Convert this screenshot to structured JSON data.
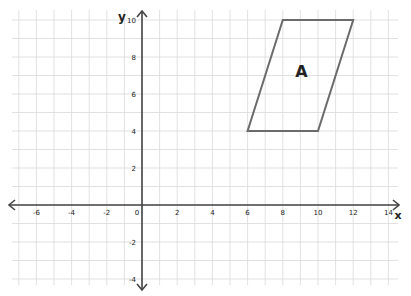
{
  "diagram": {
    "type": "coordinate-grid",
    "axes": {
      "x_label": "x",
      "y_label": "y",
      "x_range": [
        -7,
        14
      ],
      "y_range": [
        -4,
        10
      ],
      "x_ticks": [
        {
          "value": -6,
          "label": "-6"
        },
        {
          "value": -4,
          "label": "-4"
        },
        {
          "value": -2,
          "label": "-2"
        },
        {
          "value": 0,
          "label": "0"
        },
        {
          "value": 2,
          "label": "2"
        },
        {
          "value": 4,
          "label": "4"
        },
        {
          "value": 6,
          "label": "6"
        },
        {
          "value": 8,
          "label": "8"
        },
        {
          "value": 10,
          "label": "10"
        },
        {
          "value": 12,
          "label": "12"
        },
        {
          "value": 14,
          "label": "14"
        }
      ],
      "y_ticks": [
        {
          "value": 10,
          "label": "10"
        },
        {
          "value": 8,
          "label": "8"
        },
        {
          "value": 6,
          "label": "6"
        },
        {
          "value": 4,
          "label": "4"
        },
        {
          "value": 2,
          "label": "2"
        },
        {
          "value": -2,
          "label": "-2"
        },
        {
          "value": -4,
          "label": "-4"
        }
      ]
    },
    "shapes": [
      {
        "name": "A",
        "kind": "parallelogram",
        "label": "A",
        "label_position": [
          9,
          7
        ],
        "vertices": [
          [
            6,
            4
          ],
          [
            10,
            4
          ],
          [
            12,
            10
          ],
          [
            8,
            10
          ]
        ]
      }
    ],
    "colors": {
      "grid": "#d9d9d9",
      "axis": "#444444",
      "shape_stroke": "#6b6b6b",
      "text": "#222222"
    }
  }
}
